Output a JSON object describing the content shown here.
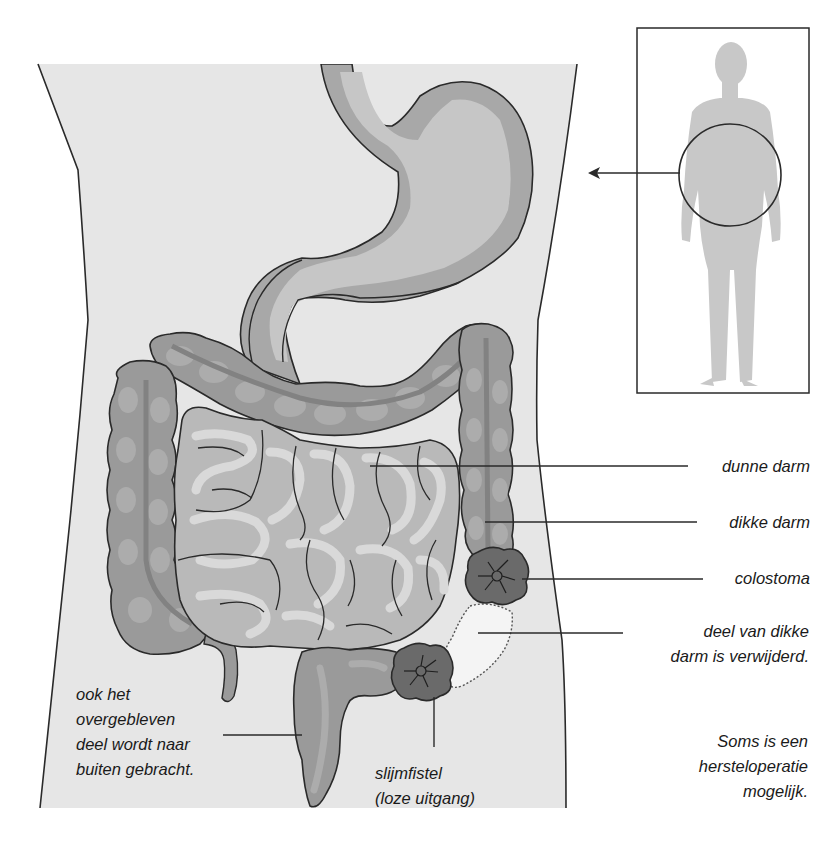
{
  "figure": {
    "language": "nl",
    "colors": {
      "paper": "#ffffff",
      "torso": "#e6e6e6",
      "outline": "#2a2a2a",
      "colon": "#9a9a9a",
      "colon_light": "#acacac",
      "colon_stripe": "#828282",
      "small_intestine": "#b9b9b9",
      "small_intestine_light": "#d9d9d9",
      "stomach": "#a8a8a8",
      "stomach_light": "#c6c6c6",
      "stoma": "#6a6a6a",
      "removed_part": "#f4f4f4",
      "silhouette": "#c8c8c8"
    }
  },
  "labels": {
    "dunne_darm": "dunne darm",
    "dikke_darm": "dikke darm",
    "colostoma": "colostoma",
    "deel_verwijderd": [
      "deel van dikke",
      "darm is verwijderd."
    ],
    "overgebleven": [
      "ook het",
      "overgebleven",
      "deel wordt naar",
      "buiten gebracht."
    ],
    "slijmfistel": [
      "slijmfistel",
      "(loze uitgang)"
    ],
    "herstel": [
      "Soms is een",
      "hersteloperatie",
      "mogelijk."
    ]
  },
  "inset": {
    "description": "lichaamssilhouet met cirkel rond de buik",
    "arrow_direction": "left"
  }
}
